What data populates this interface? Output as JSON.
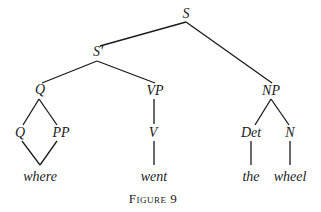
{
  "figure": {
    "caption": "Figure 9"
  },
  "tree": {
    "nodes": {
      "s": {
        "label": "S",
        "x": 186,
        "y": 14
      },
      "s_bar": {
        "label": "S'",
        "x": 98,
        "y": 52
      },
      "q_top": {
        "label": "Q",
        "x": 40,
        "y": 90
      },
      "vp": {
        "label": "VP",
        "x": 155,
        "y": 91
      },
      "np": {
        "label": "NP",
        "x": 271,
        "y": 91
      },
      "q_low": {
        "label": "Q",
        "x": 20,
        "y": 133
      },
      "pp": {
        "label": "PP",
        "x": 61,
        "y": 133
      },
      "v": {
        "label": "V",
        "x": 153,
        "y": 133
      },
      "det": {
        "label": "Det",
        "x": 251,
        "y": 133
      },
      "n": {
        "label": "N",
        "x": 290,
        "y": 133
      }
    },
    "words": {
      "where": {
        "label": "where",
        "x": 40,
        "y": 177
      },
      "went": {
        "label": "went",
        "x": 154,
        "y": 177
      },
      "the": {
        "label": "the",
        "x": 251,
        "y": 177
      },
      "wheel": {
        "label": "wheel",
        "x": 290,
        "y": 177
      }
    },
    "edges": [
      {
        "from": "S",
        "to": "S'",
        "x1": 186,
        "y1": 22,
        "x2": 100,
        "y2": 46
      },
      {
        "from": "S",
        "to": "NP",
        "x1": 186,
        "y1": 22,
        "x2": 272,
        "y2": 83
      },
      {
        "from": "S'",
        "to": "Q",
        "x1": 97,
        "y1": 61,
        "x2": 42,
        "y2": 83
      },
      {
        "from": "S'",
        "to": "VP",
        "x1": 97,
        "y1": 61,
        "x2": 155,
        "y2": 83
      },
      {
        "from": "Q",
        "to": "Q",
        "x1": 39,
        "y1": 99,
        "x2": 23,
        "y2": 125
      },
      {
        "from": "Q",
        "to": "PP",
        "x1": 39,
        "y1": 99,
        "x2": 57,
        "y2": 125
      },
      {
        "from": "Q",
        "to": "where",
        "x1": 22,
        "y1": 141,
        "x2": 40,
        "y2": 165
      },
      {
        "from": "PP",
        "to": "where",
        "x1": 57,
        "y1": 141,
        "x2": 40,
        "y2": 165
      },
      {
        "from": "VP",
        "to": "V",
        "x1": 154,
        "y1": 99,
        "x2": 154,
        "y2": 124
      },
      {
        "from": "V",
        "to": "went",
        "x1": 154,
        "y1": 141,
        "x2": 154,
        "y2": 165
      },
      {
        "from": "NP",
        "to": "Det",
        "x1": 271,
        "y1": 99,
        "x2": 255,
        "y2": 125
      },
      {
        "from": "NP",
        "to": "N",
        "x1": 271,
        "y1": 99,
        "x2": 289,
        "y2": 125
      },
      {
        "from": "Det",
        "to": "the",
        "x1": 251,
        "y1": 141,
        "x2": 251,
        "y2": 165
      },
      {
        "from": "N",
        "to": "wheel",
        "x1": 290,
        "y1": 141,
        "x2": 290,
        "y2": 165
      }
    ]
  }
}
